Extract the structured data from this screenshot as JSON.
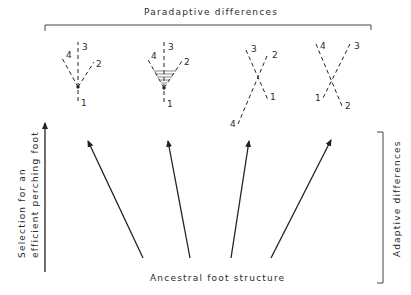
{
  "title": "Paradaptive differences",
  "bottom_label": "Ancestral foot structure",
  "left_label": {
    "line1": "Selection for an",
    "line2": "efficient perching foot"
  },
  "right_label": "Adaptive differences",
  "colors": {
    "ink": "#222222",
    "background": "#ffffff"
  },
  "feet": [
    {
      "name": "anisodactyl",
      "digits": {
        "d1": "1",
        "d2": "2",
        "d3": "3",
        "d4": "4"
      },
      "webbed": false
    },
    {
      "name": "webbed-anisodactyl",
      "digits": {
        "d1": "1",
        "d2": "2",
        "d3": "3",
        "d4": "4"
      },
      "webbed": true
    },
    {
      "name": "zygodactyl-variant",
      "digits": {
        "d1": "1",
        "d2": "2",
        "d3": "3",
        "d4": "4"
      },
      "webbed": false
    },
    {
      "name": "heterodactyl-variant",
      "digits": {
        "d1": "1",
        "d2": "2",
        "d3": "3",
        "d4": "4"
      },
      "webbed": false
    }
  ],
  "arrows_count": 4
}
